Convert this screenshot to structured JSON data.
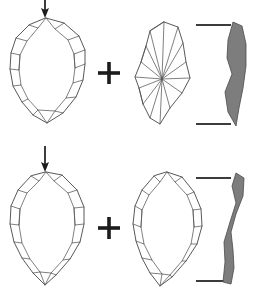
{
  "figure": {
    "title": "Lithic reduction sequence diagram",
    "description": "Archaeological line drawing showing two stages of biface reduction. Each stage pairs a plan-view outline with a flaked-face view and a shaded cross-section profile.",
    "width": 259,
    "height": 291,
    "background_color": "#ffffff",
    "stroke_color": "#3a3a3a",
    "scar_color": "#555555",
    "section_fill_color": "#7d7d7d",
    "arrow_color": "#1c1c1c"
  },
  "operators": [
    {
      "name": "plus-operator-stage-1",
      "glyph": "+",
      "x": 109,
      "y": 73
    },
    {
      "name": "plus-operator-stage-2",
      "glyph": "+",
      "x": 109,
      "y": 228
    }
  ],
  "arrows": [
    {
      "name": "input-arrow",
      "direction": "down",
      "x": 45,
      "y_start": 0,
      "y_end": 18,
      "label": "percussion input"
    },
    {
      "name": "stage-transition-arrow",
      "direction": "down",
      "x": 45,
      "y_start": 146,
      "y_end": 172,
      "label": "reduction step"
    }
  ],
  "stages": [
    {
      "name": "stage-1",
      "label": "Stage 1",
      "plan_view": {
        "name": "biface-plan-view-stage-1",
        "label": "Biface plan view, stage 1",
        "outline": "M 46 18 L 64 23 L 79 36 L 85 50 L 85 64 L 83 80 L 76 97 L 63 113 L 47 123 L 33 115 L 22 102 L 13 86 L 10 69 L 11 53 L 16 38 L 29 25 Z",
        "retouch_scars": [
          "M 46 18 L 38 28 L 29 25",
          "M 38 28 L 27 41 L 16 38",
          "M 27 41 L 20 55 L 11 53",
          "M 20 55 L 19 70 L 10 69",
          "M 19 70 L 21 85 L 13 86",
          "M 21 85 L 28 99 L 22 102",
          "M 28 99 L 38 110 L 33 115",
          "M 38 110 L 47 123",
          "M 46 18 L 55 29 L 64 23",
          "M 55 29 L 68 40 L 79 36",
          "M 68 40 L 74 54 L 85 50",
          "M 74 54 L 75 68 L 85 64",
          "M 75 68 L 73 83 L 83 80",
          "M 73 83 L 66 98 L 76 97",
          "M 66 98 L 55 111 L 63 113",
          "M 55 111 L 47 123",
          "M 38 110 L 55 111",
          "M 20 55 L 19 70",
          "M 74 54 L 75 68"
        ],
        "interior_ridges": [
          "M 46 18 L 47 123"
        ]
      },
      "flake_face_view": {
        "name": "flake-face-view-stage-1",
        "label": "Radially flaked face, stage 1",
        "outline": "M 164 22 L 178 27 L 183 43 L 186 62 L 190 78 L 182 93 L 170 108 L 160 124 L 150 118 L 143 104 L 139 88 L 135 77 L 141 62 L 146 46 L 150 31 Z",
        "radial_center": {
          "x": 162,
          "y": 79
        },
        "radial_rays": [
          "M 162 79 L 164 22",
          "M 162 79 L 178 27",
          "M 162 79 L 183 43",
          "M 162 79 L 186 62",
          "M 162 79 L 190 78",
          "M 162 79 L 182 93",
          "M 162 79 L 170 108",
          "M 162 79 L 160 124",
          "M 162 79 L 150 118",
          "M 162 79 L 143 104",
          "M 162 79 L 139 88",
          "M 162 79 L 135 77",
          "M 162 79 L 141 62",
          "M 162 79 L 146 46",
          "M 162 79 L 150 31"
        ],
        "chord_lines": [
          "M 150 31 L 164 22",
          "M 146 46 L 141 62",
          "M 139 88 L 143 104"
        ]
      },
      "section_view": {
        "name": "section-profile-stage-1",
        "label": "Cross-section profile, stage 1",
        "path": "M 233 22 L 242 26 L 246 44 L 246 66 L 243 88 L 239 108 L 236 126 L 228 112 L 225 92 L 232 74 L 227 58 L 228 40 Z",
        "fill": "#7d7d7d"
      },
      "scale_bars": [
        {
          "name": "scale-bar-top-stage-1",
          "x1": 196,
          "y1": 25,
          "x2": 231,
          "y2": 25
        },
        {
          "name": "scale-bar-bottom-stage-1",
          "x1": 196,
          "y1": 124,
          "x2": 231,
          "y2": 124
        }
      ]
    },
    {
      "name": "stage-2",
      "label": "Stage 2",
      "plan_view": {
        "name": "biface-plan-view-stage-2",
        "label": "Biface plan view, stage 2",
        "outline": "M 46 172 L 62 175 L 77 190 L 84 207 L 84 224 L 80 242 L 70 259 L 56 275 L 45 285 L 33 273 L 22 258 L 14 242 L 10 224 L 11 206 L 18 190 L 31 176 Z",
        "retouch_scars": [
          "M 46 172 L 39 181 L 31 176",
          "M 39 181 L 27 193 L 18 190",
          "M 27 193 L 20 209 L 11 206",
          "M 20 209 L 19 225 L 10 224",
          "M 19 225 L 22 243 L 14 242",
          "M 22 243 L 30 259 L 22 258",
          "M 30 259 L 40 272 L 33 273",
          "M 40 272 L 45 285",
          "M 46 172 L 54 181 L 62 175",
          "M 54 181 L 68 193 L 77 190",
          "M 68 193 L 74 208 L 84 207",
          "M 74 208 L 75 225 L 84 224",
          "M 75 225 L 72 243 L 80 242",
          "M 72 243 L 63 260 L 70 259",
          "M 63 260 L 51 273 L 56 275",
          "M 51 273 L 45 285",
          "M 40 272 L 51 273",
          "M 20 209 L 19 225",
          "M 74 208 L 75 225"
        ],
        "interior_ridges": []
      },
      "flake_face_view": {
        "name": "flake-face-view-stage-2",
        "label": "Flaked face view, stage 2",
        "outline": "M 167 172 L 182 177 L 194 192 L 201 209 L 202 226 L 197 244 L 186 261 L 172 277 L 160 286 L 150 273 L 142 258 L 136 241 L 133 224 L 135 206 L 142 190 L 154 176 Z",
        "retouch_scars": [
          "M 167 172 L 160 182 L 154 176",
          "M 160 182 L 149 195 L 142 190",
          "M 149 195 L 142 210 L 135 206",
          "M 142 210 L 141 227 L 133 224",
          "M 141 227 L 144 244 L 136 241",
          "M 144 244 L 152 260 L 142 258",
          "M 152 260 L 162 274 L 150 273",
          "M 162 274 L 160 286",
          "M 167 172 L 175 182 L 182 177",
          "M 175 182 L 187 195 L 194 192",
          "M 187 195 L 193 210 L 201 209",
          "M 193 210 L 194 227 L 202 226",
          "M 194 227 L 191 244 L 197 244",
          "M 191 244 L 182 261 L 186 261",
          "M 182 261 L 170 275 L 172 277",
          "M 170 275 L 160 286",
          "M 162 274 L 170 275",
          "M 142 210 L 141 227",
          "M 193 210 L 194 227"
        ]
      },
      "section_view": {
        "name": "section-profile-stage-2",
        "label": "Cross-section profile, stage 2",
        "path": "M 236 173 L 244 178 L 243 196 L 236 214 L 231 232 L 233 250 L 234 268 L 231 284 L 223 282 L 225 262 L 224 242 L 230 222 L 236 203 L 232 186 Z",
        "fill": "#7d7d7d"
      },
      "scale_bars": [
        {
          "name": "scale-bar-top-stage-2",
          "x1": 196,
          "y1": 178,
          "x2": 231,
          "y2": 178
        },
        {
          "name": "scale-bar-bottom-stage-2",
          "x1": 196,
          "y1": 281,
          "x2": 231,
          "y2": 281
        }
      ]
    }
  ]
}
